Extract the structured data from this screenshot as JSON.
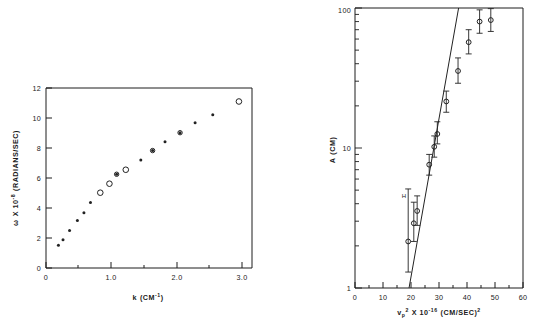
{
  "figure": {
    "background": "#ffffff",
    "ink_color": "#1c1c1c",
    "panels": [
      "dispersion-plot",
      "amplitude-plot"
    ]
  },
  "chart_data": [
    {
      "id": "dispersion-plot",
      "type": "scatter",
      "title": "",
      "xlabel": "k (CM⁻¹)",
      "ylabel": "ω X 10⁻⁸ (RADIANS/SEC)",
      "xlabel_parts": {
        "symbol": "k",
        "unit_open": "(CM",
        "unit_exp": "-1",
        "unit_close": ")"
      },
      "ylabel_parts": {
        "symbol": "ω",
        "times": "X 10",
        "exp": "-8",
        "unit": "(RADIANS/SEC)"
      },
      "xlim": [
        0,
        3.15
      ],
      "ylim": [
        0,
        12
      ],
      "xticks": [
        0,
        1.0,
        2.0,
        3.0
      ],
      "xticklabels": [
        "0",
        "1.0",
        "2.0",
        "3.0"
      ],
      "xminorticks": [
        0.5,
        1.5,
        2.5
      ],
      "yticks": [
        0,
        2,
        4,
        6,
        8,
        10,
        12
      ],
      "yticklabels": [
        "0",
        "2",
        "4",
        "6",
        "8",
        "10",
        "12"
      ],
      "grid": false,
      "legend": "none",
      "series": [
        {
          "name": "filled-points",
          "marker": "filled-dot",
          "points": [
            {
              "x": 0.19,
              "y": 1.52
            },
            {
              "x": 0.26,
              "y": 1.88
            },
            {
              "x": 0.36,
              "y": 2.5
            },
            {
              "x": 0.48,
              "y": 3.17
            },
            {
              "x": 0.58,
              "y": 3.69
            },
            {
              "x": 0.68,
              "y": 4.36
            },
            {
              "x": 1.08,
              "y": 6.25
            },
            {
              "x": 1.45,
              "y": 7.2
            },
            {
              "x": 1.63,
              "y": 7.83
            },
            {
              "x": 1.82,
              "y": 8.42
            },
            {
              "x": 2.05,
              "y": 9.02
            },
            {
              "x": 2.28,
              "y": 9.68
            },
            {
              "x": 2.55,
              "y": 10.22
            }
          ]
        },
        {
          "name": "open-points",
          "marker": "open-circle",
          "points": [
            {
              "x": 0.83,
              "y": 5.02
            },
            {
              "x": 0.97,
              "y": 5.62
            },
            {
              "x": 1.22,
              "y": 6.55
            },
            {
              "x": 2.95,
              "y": 11.1
            }
          ]
        }
      ]
    },
    {
      "id": "amplitude-plot",
      "type": "scatter",
      "title": "",
      "xlabel": "vₚ² X 10⁻¹⁶ (CM/SEC)²",
      "ylabel": "A (CM)",
      "xlabel_parts": {
        "symbol": "v",
        "sub": "p",
        "sup": "2",
        "times": "X 10",
        "exp": "-16",
        "unit_open": "(CM/SEC)",
        "unit_exp": "2"
      },
      "ylabel_parts": {
        "symbol": "A",
        "unit": "(CM)"
      },
      "xlim": [
        0,
        60
      ],
      "ylim": [
        1,
        100
      ],
      "yscale": "log",
      "xticks": [
        0,
        10,
        20,
        30,
        40,
        50,
        60
      ],
      "xticklabels": [
        "0",
        "10",
        "20",
        "30",
        "40",
        "50",
        "60"
      ],
      "yticks": [
        1,
        10,
        100
      ],
      "yticklabels": [
        "1",
        "10",
        "100"
      ],
      "grid": false,
      "legend": "none",
      "annotation": "H",
      "fit_line": {
        "x0": 19.3,
        "y0": 1.0,
        "x1": 37.0,
        "y1": 100.0
      },
      "series": [
        {
          "name": "amplitude-points",
          "marker": "open-circle-errorbar",
          "points": [
            {
              "x": 19.0,
              "y": 2.15,
              "ylow": 1.3,
              "yhigh": 5.1
            },
            {
              "x": 21.0,
              "y": 2.9,
              "ylow": 2.15,
              "yhigh": 4.1
            },
            {
              "x": 22.2,
              "y": 3.55,
              "ylow": 2.8,
              "yhigh": 4.55
            },
            {
              "x": 26.5,
              "y": 7.6,
              "ylow": 6.4,
              "yhigh": 9.0
            },
            {
              "x": 28.3,
              "y": 10.2,
              "ylow": 8.6,
              "yhigh": 12.2
            },
            {
              "x": 29.4,
              "y": 12.6,
              "ylow": 10.7,
              "yhigh": 15.4
            },
            {
              "x": 32.6,
              "y": 21.5,
              "ylow": 18.0,
              "yhigh": 25.5
            },
            {
              "x": 36.8,
              "y": 35.5,
              "ylow": 29.0,
              "yhigh": 44.0
            },
            {
              "x": 40.6,
              "y": 57.0,
              "ylow": 47.0,
              "yhigh": 70.0
            },
            {
              "x": 44.5,
              "y": 80.0,
              "ylow": 66.0,
              "yhigh": 97.0
            },
            {
              "x": 48.5,
              "y": 82.0,
              "ylow": 68.0,
              "yhigh": 99.0
            }
          ]
        }
      ]
    }
  ]
}
